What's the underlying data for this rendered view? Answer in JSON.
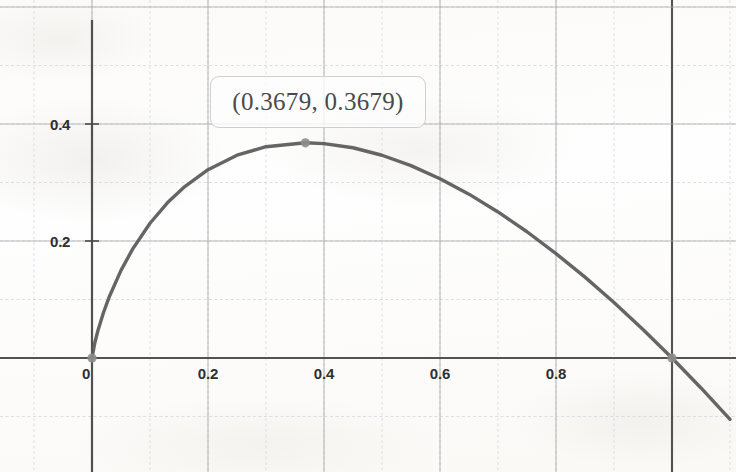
{
  "chart_data": {
    "type": "line",
    "title": "",
    "xlabel": "",
    "ylabel": "",
    "function": "y = -x ln(x)",
    "xlim": [
      -0.0165,
      1.11
    ],
    "ylim": [
      -0.1,
      0.52
    ],
    "grid": true,
    "grid_major_step_x": 0.2,
    "grid_major_step_y": 0.2,
    "grid_minor_step_x": 0.1,
    "grid_minor_step_y": 0.1,
    "legend": "none",
    "x_ticks": [
      {
        "value": 0,
        "label": "0"
      },
      {
        "value": 0.2,
        "label": "0.2"
      },
      {
        "value": 0.4,
        "label": "0.4"
      },
      {
        "value": 0.6,
        "label": "0.6"
      },
      {
        "value": 0.8,
        "label": "0.8"
      }
    ],
    "y_ticks": [
      {
        "value": 0.2,
        "label": "0.2"
      },
      {
        "value": 0.4,
        "label": "0.4"
      }
    ],
    "series": [
      {
        "name": "y = -x ln(x)",
        "color": "#585858",
        "x": [
          0.0,
          0.005,
          0.01,
          0.02,
          0.03,
          0.05,
          0.07,
          0.1,
          0.13,
          0.16,
          0.2,
          0.25,
          0.3,
          0.3679,
          0.4,
          0.45,
          0.5,
          0.55,
          0.6,
          0.65,
          0.7,
          0.75,
          0.8,
          0.85,
          0.9,
          0.95,
          1.0,
          1.05,
          1.1
        ],
        "y": [
          0.0,
          0.0265,
          0.0461,
          0.0782,
          0.1052,
          0.1498,
          0.1861,
          0.2303,
          0.2652,
          0.2931,
          0.3219,
          0.3466,
          0.3612,
          0.3679,
          0.3665,
          0.3594,
          0.3466,
          0.3288,
          0.3065,
          0.2801,
          0.2497,
          0.2158,
          0.1785,
          0.1382,
          0.0949,
          0.0487,
          0.0,
          -0.0512,
          -0.1048
        ]
      }
    ],
    "annotations": [
      {
        "name": "maximum-point-label",
        "text": "(0.3679, 0.3679)",
        "point": {
          "x": 0.3679,
          "y": 0.3679
        }
      }
    ],
    "markers": [
      {
        "name": "origin-point",
        "x": 0.0,
        "y": 0.0,
        "color": "#8d8d8d"
      },
      {
        "name": "maximum-point",
        "x": 0.3679,
        "y": 0.3679,
        "color": "#8d8d8d"
      },
      {
        "name": "root-point",
        "x": 1.0,
        "y": 0.0,
        "color": "#8d8d8d"
      }
    ],
    "colors": {
      "curve": "#585858",
      "axis": "#4a4a4a",
      "major_grid": "#a9a9a9",
      "minor_grid": "#c9cfd8",
      "marker": "#8d8d8d",
      "tick_text": "#2f2f2f",
      "background": "#fdfdfc"
    }
  },
  "tooltip": {
    "label": "(0.3679, 0.3679)"
  },
  "axis_labels": {
    "x": [
      "0",
      "0.2",
      "0.4",
      "0.6",
      "0.8"
    ],
    "y": [
      "0.2",
      "0.4"
    ]
  }
}
